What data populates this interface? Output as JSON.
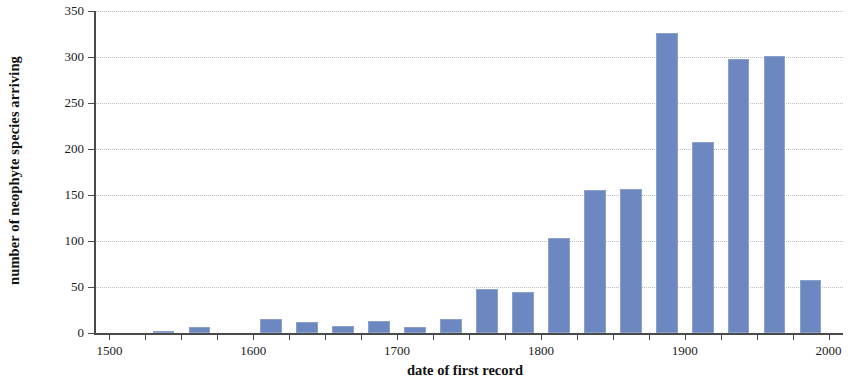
{
  "chart_data": {
    "type": "bar",
    "title": "",
    "xlabel": "date of first record",
    "ylabel": "number of neophyte species arriving",
    "xlim": [
      1490,
      2010
    ],
    "ylim": [
      0,
      350
    ],
    "bin_width": 25,
    "grid": true,
    "legend": null,
    "bar_color": "#6d88c0",
    "bar_edge_color": "#8ba0cd",
    "axis_color": "#4a4a4a",
    "gridline_color": "#b9bec9",
    "xticks_major": [
      1500,
      1600,
      1700,
      1800,
      1900,
      2000
    ],
    "xtick_labels": [
      "1500",
      "1600",
      "1700",
      "1800",
      "1900",
      "2000"
    ],
    "xticks_minor": [
      1500,
      1525,
      1550,
      1575,
      1600,
      1625,
      1650,
      1675,
      1700,
      1725,
      1750,
      1775,
      1800,
      1825,
      1850,
      1875,
      1900,
      1925,
      1950,
      1975,
      2000
    ],
    "yticks": [
      0,
      50,
      100,
      150,
      200,
      250,
      300,
      350
    ],
    "ytick_labels": [
      "0",
      "50",
      "100",
      "150",
      "200",
      "250",
      "300",
      "350"
    ],
    "categories": [
      1500,
      1525,
      1550,
      1575,
      1600,
      1625,
      1650,
      1675,
      1700,
      1725,
      1750,
      1775,
      1800,
      1825,
      1850,
      1875,
      1900,
      1925,
      1950,
      1975,
      2000
    ],
    "values": [
      0,
      0,
      2,
      6,
      0,
      15,
      12,
      8,
      13,
      6,
      15,
      48,
      45,
      103,
      155,
      157,
      326,
      208,
      298,
      301,
      58
    ],
    "bars": [
      {
        "x": 1550,
        "value": 2
      },
      {
        "x": 1575,
        "value": 6
      },
      {
        "x": 1625,
        "value": 15
      },
      {
        "x": 1650,
        "value": 12
      },
      {
        "x": 1675,
        "value": 8
      },
      {
        "x": 1700,
        "value": 13
      },
      {
        "x": 1725,
        "value": 6
      },
      {
        "x": 1750,
        "value": 15
      },
      {
        "x": 1775,
        "value": 48
      },
      {
        "x": 1800,
        "value": 45
      },
      {
        "x": 1825,
        "value": 103
      },
      {
        "x": 1850,
        "value": 155
      },
      {
        "x": 1875,
        "value": 157
      },
      {
        "x": 1900,
        "value": 326
      },
      {
        "x": 1925,
        "value": 208
      },
      {
        "x": 1950,
        "value": 298
      },
      {
        "x": 1975,
        "value": 301
      },
      {
        "x": 2000,
        "value": 58
      }
    ]
  }
}
